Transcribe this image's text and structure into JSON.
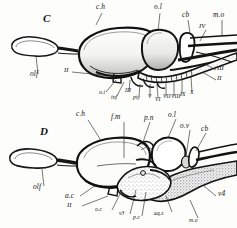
{
  "plate": {
    "background_color": "#fdfdfb",
    "ink_color": "#141414",
    "figures": [
      {
        "letter": "C",
        "caption_letter": "C",
        "description": "Lateral view of brain, figure C",
        "labels": [
          {
            "text": "C",
            "kind": "figure"
          },
          {
            "text": "c.h",
            "kind": "italic"
          },
          {
            "text": "o.l",
            "kind": "italic"
          },
          {
            "text": "cb",
            "kind": "italic"
          },
          {
            "text": "m.o",
            "kind": "italic"
          },
          {
            "text": "IV",
            "kind": "roman"
          },
          {
            "text": "olf",
            "kind": "italic"
          },
          {
            "text": "II",
            "kind": "roman"
          },
          {
            "text": "o.t",
            "kind": "italic"
          },
          {
            "text": "inf",
            "kind": "italic"
          },
          {
            "text": "III",
            "kind": "roman"
          },
          {
            "text": "pty",
            "kind": "italic"
          },
          {
            "text": "V",
            "kind": "roman"
          },
          {
            "text": "VI",
            "kind": "roman"
          },
          {
            "text": "VII",
            "kind": "roman"
          },
          {
            "text": "VIII",
            "kind": "roman"
          },
          {
            "text": "IX",
            "kind": "roman"
          },
          {
            "text": "X",
            "kind": "roman"
          },
          {
            "text": "III",
            "kind": "roman"
          },
          {
            "text": "II",
            "kind": "roman"
          }
        ]
      },
      {
        "letter": "D",
        "caption_letter": "D",
        "description": "Median sagittal section of brain, figure D",
        "labels": [
          {
            "text": "D",
            "kind": "figure"
          },
          {
            "text": "c.h",
            "kind": "italic"
          },
          {
            "text": "f.m",
            "kind": "italic"
          },
          {
            "text": "p.n",
            "kind": "italic"
          },
          {
            "text": "o.l",
            "kind": "italic"
          },
          {
            "text": "o.v",
            "kind": "italic"
          },
          {
            "text": "cb",
            "kind": "italic"
          },
          {
            "text": "olf",
            "kind": "italic"
          },
          {
            "text": "a.c",
            "kind": "italic"
          },
          {
            "text": "II",
            "kind": "roman"
          },
          {
            "text": "o.c",
            "kind": "italic"
          },
          {
            "text": "v3",
            "kind": "italic"
          },
          {
            "text": "p.c",
            "kind": "italic"
          },
          {
            "text": "aq.s",
            "kind": "italic"
          },
          {
            "text": "m.o",
            "kind": "italic"
          },
          {
            "text": "v4",
            "kind": "italic"
          }
        ]
      }
    ]
  },
  "figC": {
    "letter": "C",
    "ch": "c.h",
    "ol": "o.l",
    "cb": "cb",
    "mo": "m.o",
    "IV": "IV",
    "olf": "olf",
    "II_left": "II",
    "ot": "o.t",
    "inf": "inf",
    "III_low": "III",
    "pty": "pty",
    "V": "V",
    "VI": "VI",
    "VII": "VII",
    "VIII": "VIII",
    "IX": "IX",
    "X": "X",
    "III_right": "III",
    "II_right": "II"
  },
  "figD": {
    "letter": "D",
    "ch": "c.h",
    "fm": "f.m",
    "pn": "p.n",
    "ol": "o.l",
    "ov": "o.v",
    "cb": "cb",
    "olf": "olf",
    "ac": "a.c",
    "II": "II",
    "oc": "o.c",
    "v3": "v3",
    "pc": "p.c",
    "aqs": "aq.s",
    "mo": "m.o",
    "v4": "v4"
  }
}
